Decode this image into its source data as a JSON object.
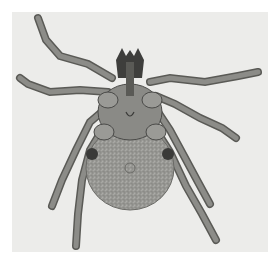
{
  "image": {
    "subject": "tick (ventral view, micrograph)",
    "background_color": "#ececea",
    "body_color": "#9a9a96",
    "leg_color": "#7c7c78",
    "dark_color": "#3a3a38"
  }
}
